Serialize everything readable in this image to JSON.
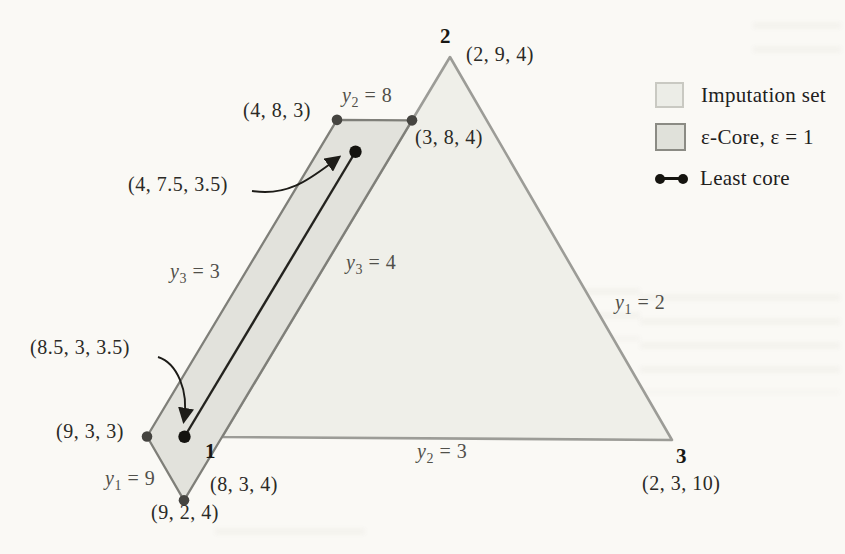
{
  "legend": {
    "items": [
      {
        "id": "imputation-set",
        "label": "Imputation set"
      },
      {
        "id": "epsilon-core",
        "label": "ε-Core, ε = 1"
      },
      {
        "id": "least-core",
        "label": "Least core"
      }
    ]
  },
  "colors": {
    "background": "#faf9f5",
    "imputation_fill": "#efefe9",
    "imputation_stroke": "#9c9c97",
    "core_fill": "#e2e2dc",
    "core_stroke": "#7f7f79",
    "least_core_line": "#24231f",
    "gray_dot": "#454440",
    "black_dot": "#14130f",
    "arrow": "#1d1c18"
  },
  "chart_data": {
    "type": "ternary-diagram",
    "epsilon": 1,
    "triangle_vertices": [
      {
        "player": "1",
        "payoff": [
          8,
          3,
          4
        ],
        "px": [
          222,
          437
        ],
        "label_px": [
          205,
          440
        ],
        "coord_label": "(8, 3, 4)",
        "coord_label_px": [
          210,
          474
        ]
      },
      {
        "player": "2",
        "payoff": [
          2,
          9,
          4
        ],
        "px": [
          450,
          57
        ],
        "label_px": [
          440,
          25
        ],
        "coord_label": "(2, 9, 4)",
        "coord_label_px": [
          466,
          44
        ]
      },
      {
        "player": "3",
        "payoff": [
          2,
          3,
          10
        ],
        "px": [
          672,
          440
        ],
        "label_px": [
          676,
          445
        ],
        "coord_label": "(2, 3, 10)",
        "coord_label_px": [
          642,
          473
        ]
      }
    ],
    "epsilon_core_vertices": [
      [
        4,
        8,
        3
      ],
      [
        3,
        8,
        4
      ],
      [
        8,
        3,
        4
      ],
      [
        9,
        2,
        4
      ],
      [
        9,
        3,
        3
      ]
    ],
    "least_core_segment": [
      [
        4,
        7.5,
        3.5
      ],
      [
        8.5,
        3,
        3.5
      ]
    ],
    "gray_dots": [
      [
        4,
        8,
        3
      ],
      [
        3,
        8,
        4
      ],
      [
        9,
        3,
        3
      ],
      [
        9,
        2,
        4
      ]
    ],
    "black_dots": [
      [
        4,
        7.5,
        3.5
      ],
      [
        8.5,
        3,
        3.5
      ]
    ],
    "point_labels": [
      {
        "text": "(4, 8, 3)",
        "px": [
          243,
          100
        ]
      },
      {
        "text": "(3, 8, 4)",
        "px": [
          415,
          127
        ]
      },
      {
        "text": "(4, 7.5, 3.5)",
        "px": [
          128,
          174
        ]
      },
      {
        "text": "(8.5, 3, 3.5)",
        "px": [
          30,
          337
        ]
      },
      {
        "text": "(9, 3, 3)",
        "px": [
          56,
          421
        ]
      },
      {
        "text": "(9, 2, 4)",
        "px": [
          151,
          502
        ]
      }
    ],
    "constraint_labels": [
      {
        "variable": "y",
        "subscript": "2",
        "value": "8",
        "px": [
          342,
          85
        ]
      },
      {
        "variable": "y",
        "subscript": "3",
        "value": "3",
        "px": [
          170,
          261
        ]
      },
      {
        "variable": "y",
        "subscript": "3",
        "value": "4",
        "px": [
          346,
          252
        ]
      },
      {
        "variable": "y",
        "subscript": "1",
        "value": "2",
        "px": [
          615,
          292
        ]
      },
      {
        "variable": "y",
        "subscript": "1",
        "value": "9",
        "px": [
          105,
          468
        ]
      },
      {
        "variable": "y",
        "subscript": "2",
        "value": "3",
        "px": [
          417,
          441
        ]
      }
    ],
    "arrows": [
      {
        "name": "arrow-to-least-core-top",
        "path": "M 252,191 C 290,197 312,177 338,158"
      },
      {
        "name": "arrow-to-least-core-bottom",
        "path": "M 158,357 C 177,363 189,391 184,420"
      }
    ]
  }
}
